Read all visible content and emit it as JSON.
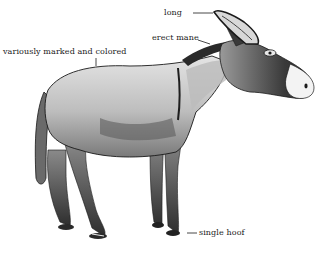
{
  "figure": {
    "colors": {
      "background": "#ffffff",
      "ink": "#1a1a1a",
      "body_light": "#d9d9d9",
      "body_mid": "#a8a8a8",
      "body_dark": "#555555",
      "mane": "#2a2a2a",
      "muzzle": "#f2f2f2"
    },
    "labels": {
      "ears": "long",
      "mane": "erect mane",
      "coat": "variously marked and colored",
      "hoof": "single hoof"
    }
  }
}
